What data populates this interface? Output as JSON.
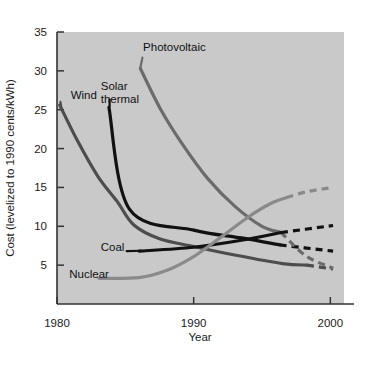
{
  "chart_data": {
    "type": "line",
    "title": "",
    "xlabel": "Year",
    "ylabel": "Cost (levelized to 1990 cents/kWh)",
    "xlim": [
      1980,
      2001
    ],
    "ylim": [
      0,
      35
    ],
    "xticks": [
      "1980",
      "1990",
      "2000"
    ],
    "xtick_values": [
      1980,
      1990,
      2000
    ],
    "yticks": [
      "5",
      "10",
      "15",
      "20",
      "25",
      "30",
      "35"
    ],
    "ytick_values": [
      5,
      10,
      15,
      20,
      25,
      30,
      35
    ],
    "grid": false,
    "legend": "inline-labels",
    "plot_background": "#c9c9c9",
    "series": [
      {
        "name": "Wind",
        "color": "#4d4d4d",
        "label": "Wind",
        "label_x": 1981.0,
        "label_y": 26.4,
        "solid_points": [
          [
            1980.2,
            25.6
          ],
          [
            1981.5,
            21.0
          ],
          [
            1983.0,
            16.4
          ],
          [
            1984.4,
            13.2
          ],
          [
            1985.6,
            10.2
          ],
          [
            1987.5,
            8.4
          ],
          [
            1990.0,
            7.4
          ],
          [
            1993.0,
            6.3
          ],
          [
            1996.5,
            5.2
          ],
          [
            1998.3,
            5.0
          ]
        ],
        "dashed_points": [
          [
            1998.3,
            5.0
          ],
          [
            2000.2,
            4.5
          ]
        ]
      },
      {
        "name": "Solar thermal",
        "color": "#111111",
        "label": "Solar thermal",
        "label_x": 1983.2,
        "label_y": 27.6,
        "solid_points": [
          [
            1983.8,
            25.3
          ],
          [
            1985.3,
            12.2
          ],
          [
            1990.0,
            9.5
          ],
          [
            1993.5,
            8.5
          ],
          [
            1996.3,
            7.6
          ]
        ],
        "dashed_points": [
          [
            1996.3,
            7.6
          ],
          [
            2000.2,
            6.8
          ]
        ]
      },
      {
        "name": "Photovoltaic",
        "color": "#6b6b6b",
        "label": "Photovoltaic",
        "label_x": 1986.3,
        "label_y": 32.6,
        "solid_points": [
          [
            1986.1,
            30.3
          ],
          [
            1987.6,
            25.0
          ],
          [
            1989.2,
            20.5
          ],
          [
            1991.0,
            16.2
          ],
          [
            1993.0,
            12.6
          ],
          [
            1995.0,
            10.0
          ],
          [
            1996.4,
            9.2
          ]
        ],
        "dashed_points": [
          [
            1996.4,
            9.2
          ],
          [
            1998.2,
            6.2
          ],
          [
            2000.2,
            4.6
          ]
        ]
      },
      {
        "name": "Coal",
        "color": "#111111",
        "label": "Coal",
        "label_x": 1983.2,
        "label_y": 6.8,
        "solid_points": [
          [
            1986.0,
            6.8
          ],
          [
            1990.0,
            7.3
          ],
          [
            1993.5,
            8.2
          ],
          [
            1996.4,
            9.2
          ]
        ],
        "dashed_points": [
          [
            1996.4,
            9.2
          ],
          [
            2000.2,
            10.1
          ]
        ]
      },
      {
        "name": "Nuclear",
        "color": "#8a8a8a",
        "label": "Nuclear",
        "label_x": 1980.9,
        "label_y": 3.4,
        "solid_points": [
          [
            1983.1,
            3.3
          ],
          [
            1986.0,
            3.4
          ],
          [
            1988.0,
            4.3
          ],
          [
            1990.0,
            6.1
          ],
          [
            1992.0,
            8.6
          ],
          [
            1994.0,
            11.2
          ],
          [
            1995.6,
            12.9
          ],
          [
            1996.8,
            13.7
          ]
        ],
        "dashed_points": [
          [
            1996.8,
            13.7
          ],
          [
            1998.4,
            14.5
          ],
          [
            2000.2,
            15.0
          ]
        ]
      }
    ]
  }
}
